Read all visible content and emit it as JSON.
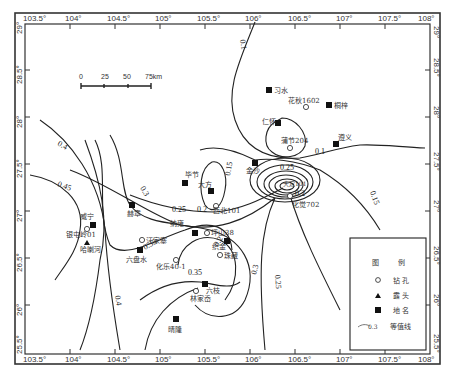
{
  "map": {
    "x_ticks": [
      "103.5°",
      "104°",
      "104.5°",
      "105°",
      "105.5°",
      "106°",
      "106.5°",
      "107°",
      "107.5°",
      "108°"
    ],
    "y_ticks_left": [
      "29°",
      "28.5°",
      "28°",
      "27.5°",
      "27°",
      "26.5°",
      "26°",
      "25.5°"
    ],
    "y_ticks_right": [
      "29°",
      "28.5°",
      "28°",
      "27.5°",
      "27°",
      "26.5°",
      "26°",
      "25.5°"
    ],
    "scale_bar": {
      "labels": [
        "0",
        "25",
        "50",
        "75km"
      ]
    },
    "places": [
      {
        "name": "习水",
        "type": "city"
      },
      {
        "name": "花秋1602",
        "type": "borehole"
      },
      {
        "name": "桐梓",
        "type": "city"
      },
      {
        "name": "仁怀",
        "type": "city"
      },
      {
        "name": "蒲节204",
        "type": "borehole"
      },
      {
        "name": "遵义",
        "type": "city"
      },
      {
        "name": "金沙",
        "type": "city"
      },
      {
        "name": "毕节",
        "type": "city"
      },
      {
        "name": "大方",
        "type": "city"
      },
      {
        "name": "西北101",
        "type": "borehole"
      },
      {
        "name": "化觉702",
        "type": "borehole"
      },
      {
        "name": "大定101",
        "type": "borehole"
      },
      {
        "name": "威宁",
        "type": "city"
      },
      {
        "name": "银屯岭01",
        "type": "borehole"
      },
      {
        "name": "哈喇河",
        "type": "outcrop"
      },
      {
        "name": "赫章",
        "type": "city"
      },
      {
        "name": "纳雍",
        "type": "city"
      },
      {
        "name": "汪家寨",
        "type": "borehole"
      },
      {
        "name": "六盘水",
        "type": "city"
      },
      {
        "name": "坪山38",
        "type": "borehole"
      },
      {
        "name": "织金",
        "type": "city"
      },
      {
        "name": "珠藏",
        "type": "borehole"
      },
      {
        "name": "化乐40-1",
        "type": "borehole"
      },
      {
        "name": "六枝",
        "type": "city"
      },
      {
        "name": "林家岙",
        "type": "borehole"
      },
      {
        "name": "晴隆",
        "type": "city"
      }
    ],
    "contour_labels": [
      "0.1",
      "0.1",
      "0.15",
      "0.15",
      "0.2",
      "0.2",
      "0.25",
      "0.25",
      "0.25",
      "0.3",
      "0.3",
      "0.35",
      "0.35",
      "0.4",
      "0.4",
      "0.45",
      "0.2"
    ],
    "legend": {
      "title_left": "图",
      "title_right": "例",
      "items": [
        {
          "symbol": "circle",
          "label": "钻 孔"
        },
        {
          "symbol": "triangle",
          "label": "露 头"
        },
        {
          "symbol": "square",
          "label": "地 名"
        },
        {
          "symbol": "isoline",
          "sample": "0.3",
          "label": "等值线"
        }
      ]
    }
  }
}
